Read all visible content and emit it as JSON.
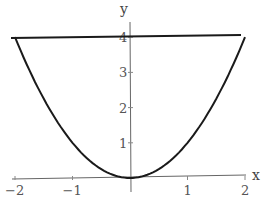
{
  "chart_data": {
    "type": "line",
    "title": "",
    "xlabel": "x",
    "ylabel": "y",
    "xlim": [
      -2,
      2
    ],
    "ylim": [
      0,
      4.3
    ],
    "grid": false,
    "x_ticks": [
      "-2",
      "-1",
      "1",
      "2"
    ],
    "y_ticks": [
      "1",
      "2",
      "3",
      "4"
    ],
    "series": [
      {
        "name": "y = x^2",
        "x": [
          -2,
          -1.5,
          -1,
          -0.5,
          0,
          0.5,
          1,
          1.5,
          2
        ],
        "y": [
          4,
          2.25,
          1,
          0.25,
          0,
          0.25,
          1,
          2.25,
          4
        ]
      },
      {
        "name": "y = 4",
        "x": [
          -2,
          2
        ],
        "y": [
          4,
          4
        ]
      }
    ]
  },
  "axes": {
    "x_label": "x",
    "y_label": "y"
  },
  "ticks": {
    "x": [
      {
        "label": "-2",
        "v": -2
      },
      {
        "label": "-1",
        "v": -1
      },
      {
        "label": "1",
        "v": 1
      },
      {
        "label": "2",
        "v": 2
      }
    ],
    "y": [
      {
        "label": "1",
        "v": 1
      },
      {
        "label": "2",
        "v": 2
      },
      {
        "label": "3",
        "v": 3
      },
      {
        "label": "4",
        "v": 4
      }
    ]
  }
}
